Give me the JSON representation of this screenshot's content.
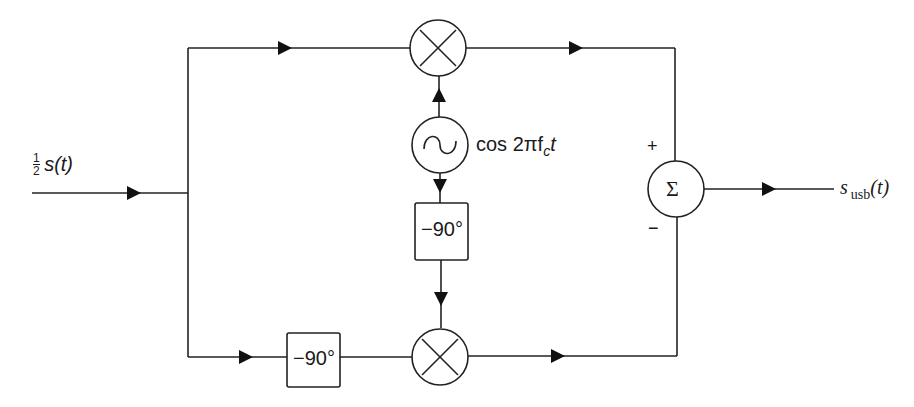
{
  "diagram": {
    "input": {
      "label_frac": "1/2",
      "label_num": "1",
      "label_den": "2",
      "label_sig": "s(t)"
    },
    "oscillator": {
      "icon": "sine-wave-icon",
      "label": "cos 2πf",
      "label_sub": "c",
      "label_tail": "t"
    },
    "phase_shift_top": {
      "label": "−90°"
    },
    "phase_shift_bottom": {
      "label": "−90°"
    },
    "mixer_top": {
      "icon": "multiply-icon"
    },
    "mixer_bottom": {
      "icon": "multiply-icon"
    },
    "summer": {
      "symbol": "Σ",
      "plus": "+",
      "minus": "−"
    },
    "output": {
      "label_main": "s",
      "label_sub": "usb",
      "label_tail": "(t)"
    }
  }
}
